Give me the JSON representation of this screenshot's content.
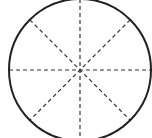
{
  "diagram": {
    "type": "circle-divided-into-sectors",
    "sectors": 8,
    "diameters": 4,
    "circle": {
      "cx": 80,
      "cy": 70,
      "r": 71,
      "stroke": "#222222",
      "stroke_width": 2
    },
    "radii_style": {
      "stroke": "#333333",
      "dash": "4,3",
      "stroke_width": 1.2
    },
    "angles_deg": [
      0,
      45,
      90,
      135
    ]
  }
}
